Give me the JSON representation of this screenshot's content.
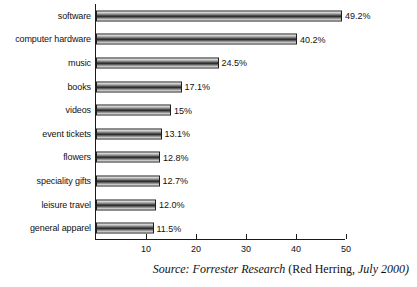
{
  "chart_data": {
    "type": "bar",
    "orientation": "horizontal",
    "title": "",
    "subtitle": "",
    "xlabel": "",
    "ylabel": "",
    "xlim": [
      0,
      50
    ],
    "xticks": [
      10,
      20,
      30,
      40,
      50
    ],
    "xtick_labels": [
      "10",
      "20",
      "30",
      "40",
      "50"
    ],
    "grid": false,
    "legend": null,
    "categories": [
      "software",
      "computer hardware",
      "music",
      "books",
      "videos",
      "event tickets",
      "flowers",
      "speciality gifts",
      "leisure travel",
      "general apparel"
    ],
    "values": [
      49.2,
      40.2,
      24.5,
      17.1,
      15,
      13.1,
      12.8,
      12.7,
      12.0,
      11.5
    ],
    "data_labels": [
      "49.2%",
      "40.2%",
      "24.5%",
      "17.1%",
      "15%",
      "13.1%",
      "12.8%",
      "12.7%",
      "12.0%",
      "11.5%"
    ],
    "annotations": [
      "Source: Forrester Research (Red Herring, July 2000)"
    ]
  },
  "source": {
    "italic_lead": "Source: Forrester Research ",
    "upright_mid": "(Red Herring,",
    "italic_tail": " July 2000)"
  },
  "colors": {
    "bar_dark": "#2e2e2e",
    "bar_light": "#ececec",
    "axis": "#1a1a1a",
    "text": "#111111",
    "background": "#ffffff"
  }
}
